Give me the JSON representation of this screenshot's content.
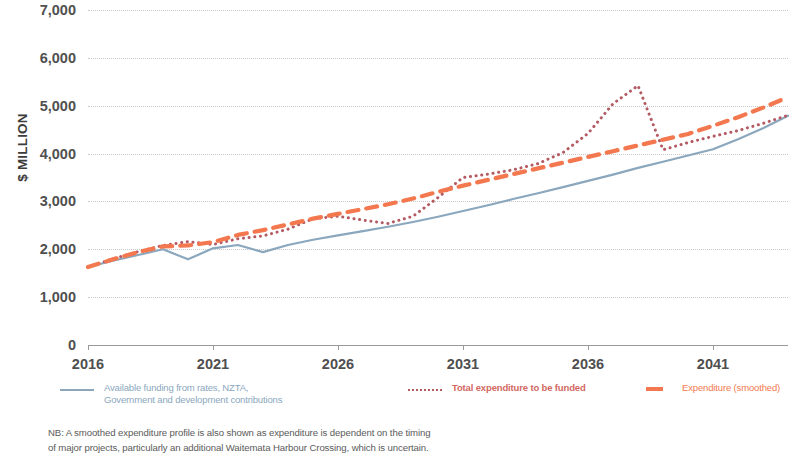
{
  "axes": {
    "y_title": "$ MILLION",
    "y_ticks": [
      "7,000",
      "6,000",
      "5,000",
      "4,000",
      "3,000",
      "2,000",
      "1,000",
      "0"
    ],
    "x_ticks": [
      "2016",
      "2021",
      "2026",
      "2031",
      "2036",
      "2041"
    ]
  },
  "legend": {
    "items": [
      {
        "label_line1": "Available funding from rates, NZTA,",
        "label_line2": "Government and development contributions",
        "style": "solid",
        "color": "#8aa7bd"
      },
      {
        "label_line1": "Total expenditure to be funded",
        "label_line2": "",
        "style": "dotted",
        "color": "#d2685f"
      },
      {
        "label_line1": "Expenditure (smoothed)",
        "label_line2": "",
        "style": "dashed",
        "color": "#f4784f"
      }
    ]
  },
  "footnote": {
    "line1": "NB: A smoothed expenditure profile is also shown as expenditure is dependent on the timing",
    "line2": "of major projects, particularly an additional Waitemata Harbour Crossing, which is uncertain."
  },
  "chart_data": {
    "type": "line",
    "title": "",
    "xlabel": "",
    "ylabel": "$ MILLION",
    "xlim": [
      2016,
      2044
    ],
    "ylim": [
      0,
      7000
    ],
    "grid": true,
    "legend_position": "bottom",
    "x": [
      2016,
      2017,
      2018,
      2019,
      2020,
      2021,
      2022,
      2023,
      2024,
      2025,
      2026,
      2027,
      2028,
      2029,
      2030,
      2031,
      2032,
      2033,
      2034,
      2035,
      2036,
      2037,
      2038,
      2039,
      2040,
      2041,
      2042,
      2043,
      2044
    ],
    "series": [
      {
        "name": "Available funding from rates, NZTA, Government and development contributions",
        "style": "solid",
        "color": "#8aa7bd",
        "values": [
          1630,
          1760,
          1880,
          2000,
          1790,
          2020,
          2090,
          1940,
          2090,
          2200,
          2290,
          2380,
          2470,
          2570,
          2680,
          2800,
          2920,
          3050,
          3170,
          3300,
          3430,
          3560,
          3700,
          3830,
          3960,
          4090,
          4300,
          4530,
          4790
        ]
      },
      {
        "name": "Total expenditure to be funded",
        "style": "dotted",
        "color": "#b35a63",
        "values": [
          1630,
          1800,
          1950,
          2080,
          2160,
          2100,
          2220,
          2280,
          2420,
          2640,
          2690,
          2610,
          2540,
          2690,
          3080,
          3500,
          3570,
          3660,
          3790,
          4020,
          4420,
          5040,
          5420,
          4080,
          4230,
          4360,
          4480,
          4630,
          4800
        ]
      },
      {
        "name": "Expenditure (smoothed)",
        "style": "dashed",
        "color": "#f4784f",
        "values": [
          1630,
          1790,
          1940,
          2060,
          2080,
          2150,
          2300,
          2400,
          2520,
          2640,
          2740,
          2840,
          2940,
          3060,
          3200,
          3330,
          3450,
          3570,
          3690,
          3810,
          3930,
          4050,
          4170,
          4290,
          4410,
          4580,
          4760,
          4960,
          5180
        ]
      }
    ]
  }
}
